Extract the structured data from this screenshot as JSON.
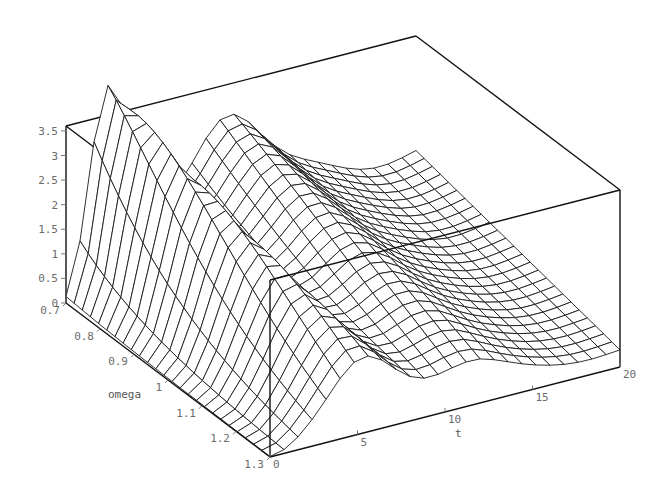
{
  "chart_data": {
    "type": "surface3d",
    "title": "",
    "renderer_style": "wireframe mesh, black lines on white, boxed axes",
    "axes": {
      "x": {
        "label": "t",
        "range": [
          0,
          20
        ],
        "ticks": [
          0,
          5,
          10,
          15,
          20
        ]
      },
      "y": {
        "label": "omega",
        "range": [
          0.7,
          1.3
        ],
        "ticks": [
          0.7,
          0.8,
          0.9,
          1,
          1.1,
          1.2,
          1.3
        ]
      },
      "z": {
        "label": "",
        "range": [
          0,
          3.6
        ],
        "ticks": [
          0,
          0.5,
          1,
          1.5,
          2,
          2.5,
          3,
          3.5
        ]
      }
    },
    "tick_labels": {
      "z": [
        "0",
        "0.5",
        "1",
        "1.5",
        "2",
        "2.5",
        "3",
        "3.5"
      ],
      "omega": [
        "0.7",
        "0.8",
        "0.9",
        "1",
        "1.1",
        "1.2",
        "1.3"
      ],
      "t": [
        "0",
        "5",
        "10",
        "15",
        "20"
      ]
    },
    "grid": {
      "t_lines": 25,
      "omega_lines": 25
    },
    "surface_description": "Value is ~0 at t=0, rises to a sharp peak of ~3.6 near t~2-3 at omega=0.7; the ridge shifts to larger t and lower height as omega increases (about 1.2-1.5 near t~5 at omega=1.3). A second broad hump of ~3.0 appears near t~9-10 at omega=0.7, with decaying oscillations toward t=20 where values settle near 0.6-1.0.",
    "sample_values": {
      "omega_0.7": {
        "t": [
          0,
          2.5,
          5,
          9.5,
          15,
          20
        ],
        "z": [
          0.0,
          3.6,
          2.4,
          3.0,
          2.6,
          2.0
        ]
      },
      "omega_1.0": {
        "t": [
          0,
          4,
          8,
          12,
          16,
          20
        ],
        "z": [
          0.0,
          2.2,
          1.1,
          1.3,
          1.2,
          1.0
        ]
      },
      "omega_1.3": {
        "t": [
          0,
          5,
          8,
          12,
          16,
          20
        ],
        "z": [
          0.0,
          1.4,
          0.4,
          0.8,
          0.7,
          0.6
        ]
      }
    }
  },
  "labels": {
    "z_ticks": [
      "0",
      "0.5",
      "1",
      "1.5",
      "2",
      "2.5",
      "3",
      "3.5"
    ],
    "omega_ticks": [
      "0.7",
      "0.8",
      "0.9",
      "1",
      "1.1",
      "1.2",
      "1.3"
    ],
    "t_ticks": [
      "0",
      "5",
      "10",
      "15",
      "20"
    ],
    "omega_title": "omega",
    "t_title": "t"
  }
}
